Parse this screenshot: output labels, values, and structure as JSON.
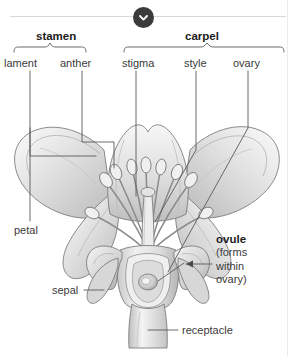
{
  "viewer": {
    "collapse_icon": "chevron-down-icon",
    "accent_dark": "#3b3b3b",
    "divider_color": "#d8d6d6",
    "background": "#ffffff"
  },
  "diagram": {
    "groups": [
      {
        "key": "stamen",
        "label": "stamen",
        "members": [
          "filament",
          "anther"
        ]
      },
      {
        "key": "carpel",
        "label": "carpel",
        "members": [
          "stigma",
          "style",
          "ovary"
        ]
      }
    ],
    "labels": {
      "stamen": "stamen",
      "carpel": "carpel",
      "filament": "lament",
      "anther": "anther",
      "stigma": "stigma",
      "style": "style",
      "ovary": "ovary",
      "petal": "petal",
      "sepal": "sepal",
      "receptacle": "receptacle"
    },
    "ovule": {
      "title": "ovule",
      "line1": "(forms",
      "line2": "within",
      "line3": "ovary)"
    },
    "art_colors": {
      "outline": "#6f6f6f",
      "petal_light": "#f2f2f2",
      "petal_mid": "#d9d9d9",
      "petal_dark": "#b4b4b4",
      "leader": "#4a4a4a"
    }
  }
}
